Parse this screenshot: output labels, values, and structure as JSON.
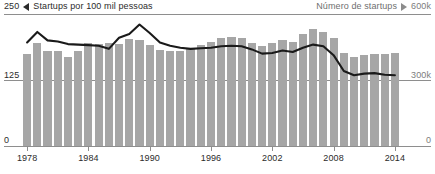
{
  "header": {
    "left_axis_max": "250",
    "left_marker_icon": "triangle-left-icon",
    "left_series_label": "Startups por 100 mil pessoas",
    "right_series_label": "Número de startups",
    "right_marker_icon": "triangle-right-icon",
    "right_axis_max": "600k"
  },
  "axes": {
    "left_mid": "125",
    "left_min": "0",
    "right_mid": "300k",
    "right_min": "0"
  },
  "colors": {
    "bar": "#a6a6a6",
    "line": "#1a1a1a",
    "axis": "#8e8e8e",
    "text": "#2b2b2b",
    "muted_text": "#7d7d7d",
    "background": "#ffffff"
  },
  "chart_data": {
    "type": "bar",
    "title": "",
    "subtitle": "",
    "xlabel": "",
    "ylabel": "Startups por 100 mil pessoas",
    "y2label": "Número de startups",
    "grid": true,
    "legend_position": "top",
    "ylim": [
      0,
      250
    ],
    "y2lim": [
      0,
      600000
    ],
    "yticks": [
      0,
      125,
      250
    ],
    "ytick_labels": [
      "0",
      "125",
      "250"
    ],
    "y2ticks": [
      0,
      300000,
      600000
    ],
    "y2tick_labels": [
      "0",
      "300k",
      "600k"
    ],
    "xlim": [
      1978,
      2014
    ],
    "xticks": [
      1978,
      1984,
      1990,
      1996,
      2002,
      2008,
      2014
    ],
    "xtick_labels": [
      "1978",
      "1984",
      "1990",
      "1996",
      "2002",
      "2008",
      "2014"
    ],
    "categories": [
      1978,
      1979,
      1980,
      1981,
      1982,
      1983,
      1984,
      1985,
      1986,
      1987,
      1988,
      1989,
      1990,
      1991,
      1992,
      1993,
      1994,
      1995,
      1996,
      1997,
      1998,
      1999,
      2000,
      2001,
      2002,
      2003,
      2004,
      2005,
      2006,
      2007,
      2008,
      2009,
      2010,
      2011,
      2012,
      2013,
      2014
    ],
    "series": [
      {
        "name": "Número de startups",
        "axis": "right",
        "render": "bar",
        "unit": "startups",
        "values": [
          420000,
          470000,
          430000,
          430000,
          405000,
          430000,
          470000,
          465000,
          470000,
          465000,
          485000,
          480000,
          460000,
          435000,
          430000,
          430000,
          440000,
          460000,
          475000,
          490000,
          495000,
          490000,
          470000,
          455000,
          470000,
          480000,
          475000,
          510000,
          530000,
          520000,
          490000,
          425000,
          405000,
          415000,
          420000,
          420000,
          425000
        ]
      },
      {
        "name": "Startups por 100 mil pessoas",
        "axis": "left",
        "render": "line",
        "unit": "por 100 mil pessoas",
        "values": [
          196,
          216,
          200,
          198,
          193,
          192,
          191,
          190,
          184,
          205,
          212,
          230,
          214,
          196,
          190,
          186,
          184,
          185,
          186,
          189,
          190,
          189,
          183,
          175,
          176,
          181,
          178,
          186,
          192,
          189,
          172,
          142,
          134,
          137,
          138,
          135,
          134
        ]
      }
    ]
  }
}
